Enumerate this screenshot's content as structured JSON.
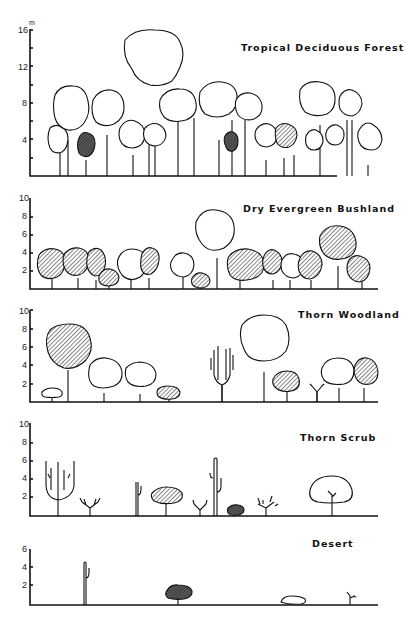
{
  "diagram": {
    "unit_label": "m",
    "panels": [
      {
        "name": "Tropical Deciduous Forest",
        "y_ticks": [
          "16",
          "12",
          "8",
          "4"
        ],
        "max_height_m": 16
      },
      {
        "name": "Dry Evergreen Bushland",
        "y_ticks": [
          "10",
          "8",
          "6",
          "4",
          "2"
        ],
        "max_height_m": 10
      },
      {
        "name": "Thorn Woodland",
        "y_ticks": [
          "10",
          "8",
          "6",
          "4",
          "2"
        ],
        "max_height_m": 10
      },
      {
        "name": "Thorn Scrub",
        "y_ticks": [
          "10",
          "8",
          "6",
          "4",
          "2"
        ],
        "max_height_m": 10
      },
      {
        "name": "Desert",
        "y_ticks": [
          "6",
          "4",
          "2"
        ],
        "max_height_m": 6
      }
    ],
    "legend_notes": {
      "open_crown": "deciduous / leafless crown (white)",
      "hatched_crown": "evergreen crown (hatched)"
    }
  }
}
